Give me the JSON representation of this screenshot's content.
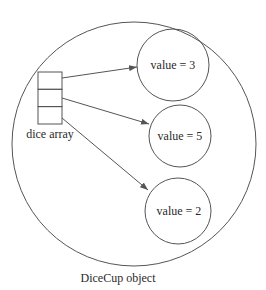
{
  "diagram": {
    "container": {
      "label": "DiceCup object",
      "cx": 134,
      "cy": 144,
      "r": 122
    },
    "array": {
      "label": "dice array",
      "x": 38,
      "y": 72,
      "width": 24,
      "cells": 3,
      "cell_height": 17.3
    },
    "objects": [
      {
        "label": "value = 3",
        "cx": 173,
        "cy": 65,
        "r": 36
      },
      {
        "label": "value = 5",
        "cx": 180,
        "cy": 136,
        "r": 31
      },
      {
        "label": "value = 2",
        "cx": 178,
        "cy": 211,
        "r": 33
      }
    ],
    "arrows": [
      {
        "from": [
          62,
          76
        ],
        "to": [
          137,
          67
        ]
      },
      {
        "from": [
          62,
          101
        ],
        "to": [
          148,
          124
        ]
      },
      {
        "from": [
          62,
          119
        ],
        "to": [
          148,
          190
        ]
      }
    ],
    "colors": {
      "stroke": "#555555",
      "text": "#2a2a2a",
      "background": "#ffffff"
    }
  }
}
